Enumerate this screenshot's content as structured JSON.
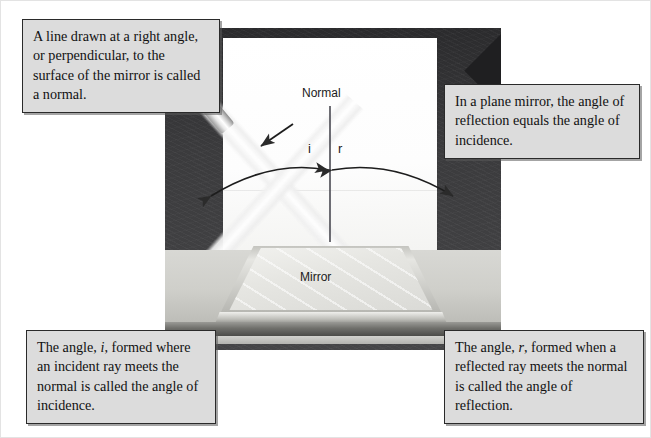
{
  "diagram_labels": {
    "normal": "Normal",
    "mirror": "Mirror",
    "angle_incidence_symbol": "i",
    "angle_reflection_symbol": "r"
  },
  "captions": {
    "top_left": {
      "text": "A line drawn at a right angle, or perpendicular, to the surface of the mirror is called a normal."
    },
    "top_right": {
      "text": "In a plane mirror, the angle of reflection equals the angle of incidence."
    },
    "bottom_left": {
      "lead": "The angle,",
      "symbol": "i",
      "rest": ", formed where an incident ray meets the normal is called the angle of incidence."
    },
    "bottom_right": {
      "lead": "The angle,",
      "symbol": "r",
      "rest": ", formed when a reflected ray meets the normal is called the angle of reflection."
    }
  },
  "scene": {
    "light_source": "flashlight",
    "incident_ray": "incident-light-beam",
    "reflected_ray": "reflected-light-beam",
    "surface": "plane-mirror-on-table",
    "normal_line": "vertical-normal-line",
    "angle_arc_left": "angle-of-incidence-arc",
    "angle_arc_right": "angle-of-reflection-arc"
  },
  "colors": {
    "caption_fill": "#dcdcdc",
    "caption_border": "#2a2a2a",
    "panel": "#ffffff",
    "dark_surround": "#3b3b3d",
    "ink": "#111111"
  }
}
